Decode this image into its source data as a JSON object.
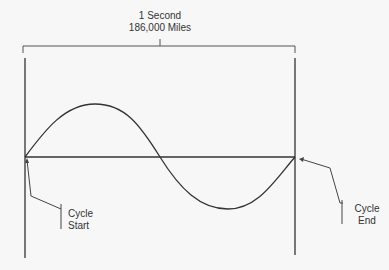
{
  "header": {
    "line1": "1 Second",
    "line2": "186,000 Miles"
  },
  "callouts": {
    "start": {
      "line1": "Cycle",
      "line2": "Start"
    },
    "end": {
      "line1": "Cycle",
      "line2": "End"
    }
  },
  "colors": {
    "line": "#333333",
    "background": "#f7f7f7"
  }
}
